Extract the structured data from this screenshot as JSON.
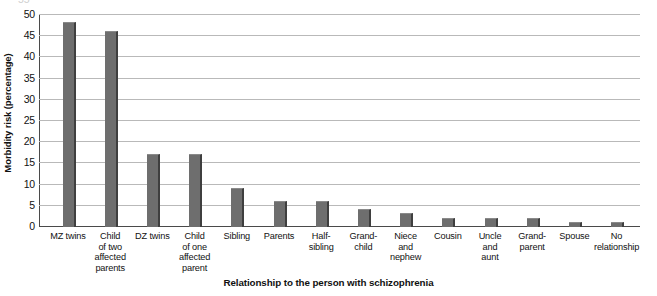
{
  "chart_data": {
    "type": "bar",
    "title": "",
    "xlabel": "Relationship to the person with schizophrenia",
    "ylabel": "Morbidity risk (percentage)",
    "ylim": [
      0,
      50
    ],
    "ytick_step": 5,
    "yticks": [
      "0",
      "5",
      "10",
      "15",
      "20",
      "25",
      "30",
      "35",
      "40",
      "45",
      "50"
    ],
    "partial_top_tick": "55",
    "grid": true,
    "legend": "none",
    "bar_color": "#6e6e6e",
    "bar_shadow_color": "#3f3f3f",
    "categories": [
      "MZ twins",
      "Child of two affected parents",
      "DZ twins",
      "Child of one affected parent",
      "Sibling",
      "Parents",
      "Half-sibling",
      "Grandchild",
      "Niece and nephew",
      "Cousin",
      "Uncle and aunt",
      "Grandparent",
      "Spouse",
      "No relationship"
    ],
    "category_lines": [
      [
        "MZ twins"
      ],
      [
        "Child",
        "of two",
        "affected",
        "parents"
      ],
      [
        "DZ twins"
      ],
      [
        "Child",
        "of one",
        "affected",
        "parent"
      ],
      [
        "Sibling"
      ],
      [
        "Parents"
      ],
      [
        "Half-",
        "sibling"
      ],
      [
        "Grand-",
        "child"
      ],
      [
        "Niece",
        "and",
        "nephew"
      ],
      [
        "Cousin"
      ],
      [
        "Uncle",
        "and",
        "aunt"
      ],
      [
        "Grand-",
        "parent"
      ],
      [
        "Spouse"
      ],
      [
        "No",
        "relationship"
      ]
    ],
    "values": [
      48,
      46,
      17,
      17,
      9,
      6,
      6,
      4,
      3,
      2,
      2,
      2,
      1,
      1
    ]
  }
}
